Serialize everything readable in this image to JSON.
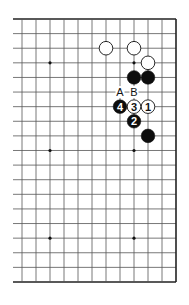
{
  "diagram": {
    "type": "go-board-corner",
    "columns": 12,
    "rows": 19,
    "origin": {
      "x": 22,
      "y": 19
    },
    "spacing": {
      "x": 14,
      "y": 14.61
    },
    "left_stub_x": 13,
    "line_color": "#555555",
    "edge_color": "#222222",
    "star_points": [
      [
        2,
        3
      ],
      [
        8,
        3
      ],
      [
        2,
        9
      ],
      [
        8,
        9
      ],
      [
        2,
        15
      ],
      [
        8,
        15
      ]
    ],
    "stones": [
      {
        "color": "white",
        "col": 6,
        "row": 2,
        "label": ""
      },
      {
        "color": "white",
        "col": 8,
        "row": 2,
        "label": ""
      },
      {
        "color": "white",
        "col": 9,
        "row": 3,
        "label": ""
      },
      {
        "color": "black",
        "col": 8,
        "row": 4,
        "label": ""
      },
      {
        "color": "black",
        "col": 9,
        "row": 4,
        "label": ""
      },
      {
        "color": "white",
        "col": 9,
        "row": 6,
        "label": "1"
      },
      {
        "color": "black",
        "col": 8,
        "row": 7,
        "label": "2"
      },
      {
        "color": "white",
        "col": 8,
        "row": 6,
        "label": "3"
      },
      {
        "color": "black",
        "col": 7,
        "row": 6,
        "label": "4"
      },
      {
        "color": "black",
        "col": 9,
        "row": 8,
        "label": ""
      }
    ],
    "markers": [
      {
        "text": "A",
        "col": 7,
        "row": 5
      },
      {
        "text": "B",
        "col": 8,
        "row": 5
      }
    ]
  }
}
